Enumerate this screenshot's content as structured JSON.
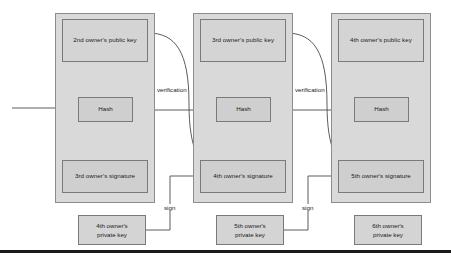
{
  "diagram": {
    "type": "flow-diagram",
    "colors": {
      "panel_fill": "#d9d9d9",
      "box_fill": "#d0d0d0",
      "stroke": "#7a7a7a",
      "line": "#4a4a4a",
      "text": "#1b1b1b",
      "baseline": "#1a1a1a"
    },
    "panels": [
      {
        "id": "transaction-1",
        "public_key": "2nd owner's public key",
        "hash": "Hash",
        "signature": "3rd owner's signature"
      },
      {
        "id": "transaction-2",
        "public_key": "3rd owner's public key",
        "hash": "Hash",
        "signature": "4th owner's signature"
      },
      {
        "id": "transaction-3",
        "public_key": "4th owner's public key",
        "hash": "Hash",
        "signature": "5th owner's signature"
      }
    ],
    "private_keys": [
      {
        "id": "private-key-1",
        "label": "4th owner's\nprivate key",
        "line1": "4th owner's",
        "line2": "private key"
      },
      {
        "id": "private-key-2",
        "label": "5th owner's\nprivate key",
        "line1": "5th owner's",
        "line2": "private key"
      },
      {
        "id": "private-key-3",
        "label": "6th owner's\nprivate key",
        "line1": "6th owner's",
        "line2": "private key"
      }
    ],
    "edge_labels": {
      "verification_1": "verification",
      "verification_2": "verification",
      "sign_1": "sign",
      "sign_2": "sign"
    }
  }
}
